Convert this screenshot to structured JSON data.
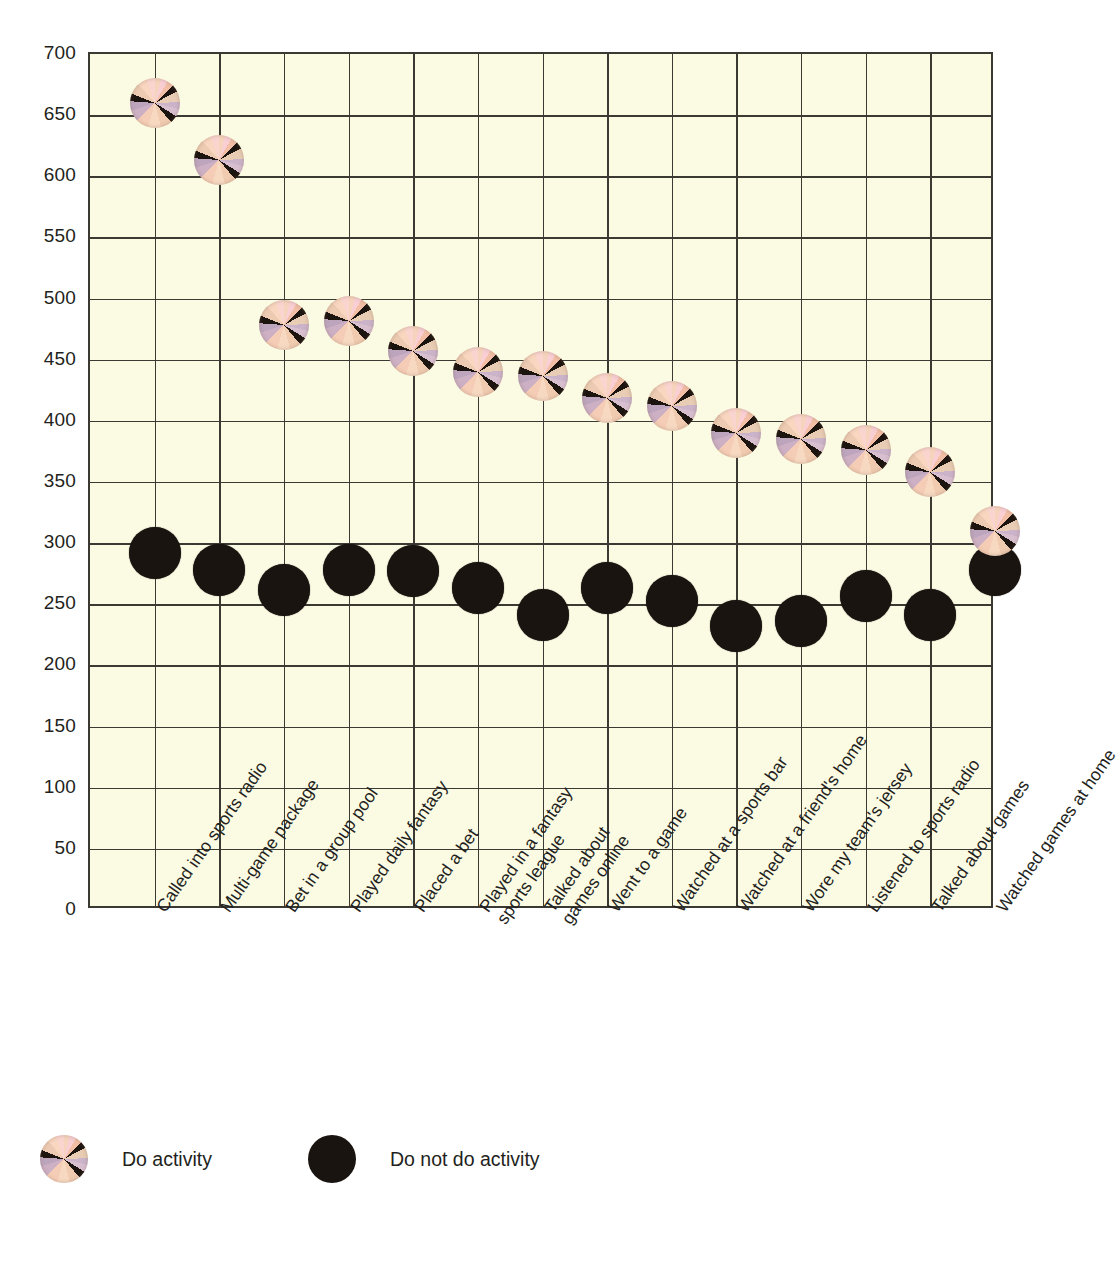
{
  "chart_data": {
    "type": "scatter",
    "title": "",
    "xlabel": "",
    "ylabel": "",
    "ylim": [
      0,
      700
    ],
    "ytick_step": 50,
    "yticks": [
      700,
      650,
      600,
      550,
      500,
      450,
      400,
      350,
      300,
      250,
      200,
      150,
      100,
      50,
      0
    ],
    "grid": true,
    "legend_position": "bottom-left",
    "plot_background": "#fbfbe4",
    "grid_color": "#3a3a32",
    "categories": [
      "Called into sports radio",
      "Multi-game package",
      "Bet in a group pool",
      "Played daily fantasy",
      "Placed a bet",
      "Played in a fantasy sports league",
      "Talked about games online",
      "Went to a game",
      "Watched at a sports bar",
      "Watched at a friend's home",
      "Wore my team's jersey",
      "Listened to sports radio",
      "Talked about games",
      "Watched games at home"
    ],
    "category_lines": [
      [
        "Called into sports radio"
      ],
      [
        "Multi-game package"
      ],
      [
        "Bet in a group pool"
      ],
      [
        "Played daily fantasy"
      ],
      [
        "Placed a bet"
      ],
      [
        "Played in a fantasy",
        "sports league"
      ],
      [
        "Talked about",
        "games online"
      ],
      [
        "Went to a game"
      ],
      [
        "Watched at a sports bar"
      ],
      [
        "Watched at a friend's home"
      ],
      [
        "Wore my team's jersey"
      ],
      [
        "Listened to sports radio"
      ],
      [
        "Talked about games"
      ],
      [
        "Watched games at home"
      ]
    ],
    "series": [
      {
        "name": "Do activity",
        "marker": "pinwheel-icon",
        "color": "#f2cbb4",
        "values": [
          660,
          613,
          478,
          482,
          457,
          440,
          437,
          419,
          412,
          390,
          385,
          376,
          358,
          310
        ]
      },
      {
        "name": "Do not do activity",
        "marker": "black-circle-icon",
        "color": "#1a1410",
        "values": [
          292,
          278,
          262,
          278,
          277,
          263,
          241,
          263,
          253,
          232,
          236,
          257,
          241,
          278
        ]
      }
    ]
  },
  "legend": {
    "entries": [
      {
        "label": "Do activity",
        "marker": "pinwheel-icon"
      },
      {
        "label": "Do not do activity",
        "marker": "black-circle-icon"
      }
    ]
  }
}
